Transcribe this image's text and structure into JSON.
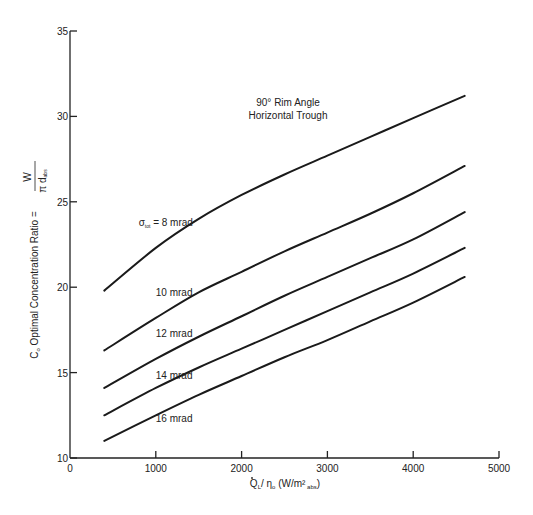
{
  "chart_data": {
    "type": "line",
    "title": "90° Rim Angle Horizontal Trough",
    "annotation_lines": [
      "90° Rim Angle",
      "Horizontal Trough"
    ],
    "xlabel": "Q̇L / ηo (W/m² abs)",
    "ylabel": "Co Optimal Concentration Ratio = W / (π d abs)",
    "xlim": [
      0,
      5000
    ],
    "ylim": [
      10,
      35
    ],
    "x_ticks": [
      0,
      1000,
      2000,
      3000,
      4000,
      5000
    ],
    "y_ticks": [
      10,
      15,
      20,
      25,
      30,
      35
    ],
    "grid": false,
    "legend": "inline labels",
    "x": [
      400,
      1000,
      1500,
      2000,
      2500,
      3000,
      3500,
      4000,
      4600
    ],
    "series": [
      {
        "name": "σtot = 8 mrad",
        "label_pos": [
          800,
          23.6
        ],
        "values": [
          19.8,
          22.3,
          24.0,
          25.4,
          26.6,
          27.7,
          28.8,
          29.9,
          31.2
        ]
      },
      {
        "name": "10 mrad",
        "label_pos": [
          1000,
          19.5
        ],
        "values": [
          16.3,
          18.2,
          19.7,
          20.9,
          22.1,
          23.2,
          24.3,
          25.5,
          27.1
        ]
      },
      {
        "name": "12 mrad",
        "label_pos": [
          1000,
          17.1
        ],
        "values": [
          14.1,
          15.8,
          17.1,
          18.3,
          19.5,
          20.6,
          21.7,
          22.8,
          24.4
        ]
      },
      {
        "name": "14 mrad",
        "label_pos": [
          1000,
          14.6
        ],
        "values": [
          12.5,
          14.1,
          15.3,
          16.4,
          17.5,
          18.6,
          19.7,
          20.8,
          22.3
        ]
      },
      {
        "name": "16 mrad",
        "label_pos": [
          1000,
          12.1
        ],
        "values": [
          11.0,
          12.5,
          13.7,
          14.8,
          15.9,
          16.9,
          18.0,
          19.1,
          20.6
        ]
      }
    ]
  },
  "labels": {
    "y_axis_prefix": "C",
    "y_axis_sub": "o",
    "y_axis_text": " Optimal Concentration Ratio = ",
    "y_axis_frac_num": "W",
    "y_axis_frac_den": "π d",
    "y_axis_frac_den_sub": "abs",
    "x_axis_q": "Q",
    "x_axis_q_sub": "L",
    "x_axis_mid": "/ η",
    "x_axis_eta_sub": "o",
    "x_axis_units": " (W/m²",
    "x_axis_units_sub": " abs",
    "x_axis_close": ")",
    "sigma": "σ",
    "sigma_sub": "tot",
    "first_label_rest": " =  8 mrad"
  }
}
